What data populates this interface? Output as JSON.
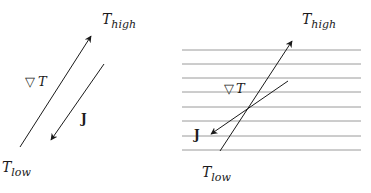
{
  "left_panel": {
    "t_high": {
      "main": "T",
      "sub": "high"
    },
    "t_low": {
      "main": "T",
      "sub": "low"
    },
    "gradient_label": {
      "symbol": "▽",
      "var": "T"
    },
    "flux_label": "J"
  },
  "right_panel": {
    "t_high": {
      "main": "T",
      "sub": "high"
    },
    "t_low": {
      "main": "T",
      "sub": "low"
    },
    "gradient_label": {
      "symbol": "▽",
      "var": "T"
    },
    "flux_label": "J",
    "layer_lines_count": 8
  },
  "colors": {
    "ink": "#1a1a1a",
    "layer_line": "#9a9a9a"
  }
}
